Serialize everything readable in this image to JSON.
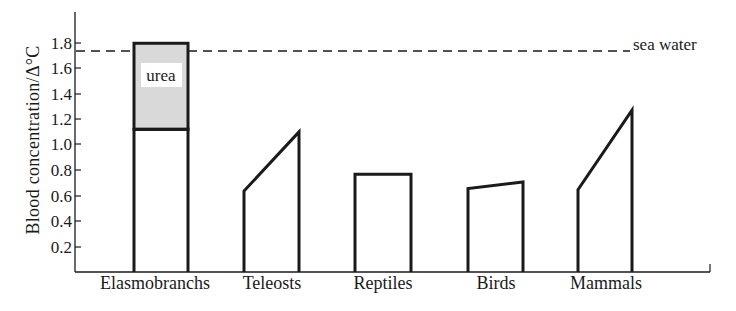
{
  "chart_data": {
    "type": "bar",
    "title": "",
    "xlabel": "",
    "ylabel": "Blood concentration/Δ°C",
    "ylim": [
      0,
      2.0
    ],
    "yticks": [
      0.2,
      0.4,
      0.6,
      0.8,
      1.0,
      1.2,
      1.4,
      1.6,
      1.8
    ],
    "ytick_labels": [
      "0.2",
      "0.4",
      "0.6",
      "0.8",
      "1.0",
      "1.2",
      "1.4",
      "1.6",
      "1.8"
    ],
    "grid": false,
    "legend": null,
    "categories": [
      "Elasmobranchs",
      "Teleosts",
      "Reptiles",
      "Birds",
      "Mammals"
    ],
    "series": [
      {
        "name": "Blood concentration (range low)",
        "values": [
          1.11,
          0.63,
          0.76,
          0.65,
          0.64
        ]
      },
      {
        "name": "Blood concentration (range high)",
        "values": [
          1.11,
          1.09,
          0.76,
          0.7,
          1.26
        ]
      },
      {
        "name": "Urea contribution (Elasmobranchs)",
        "values": [
          0.67,
          0,
          0,
          0,
          0
        ]
      }
    ],
    "stacked_segment": {
      "category": "Elasmobranchs",
      "base": 1.11,
      "top": 1.78,
      "label": "urea",
      "fill": "#d9d9d9"
    },
    "reference_lines": [
      {
        "orientation": "horizontal",
        "value": 1.72,
        "style": "dashed",
        "label": "sea water"
      }
    ],
    "annotations": [
      {
        "text": "urea",
        "category": "Elasmobranchs",
        "y": 1.52
      },
      {
        "text": "sea water",
        "y": 1.72,
        "position": "right"
      }
    ]
  },
  "labels": {
    "ylabel": "Blood concentration/Δ°C",
    "sea_water": "sea water",
    "urea": "urea",
    "categories": [
      "Elasmobranchs",
      "Teleosts",
      "Reptiles",
      "Birds",
      "Mammals"
    ],
    "yticks": [
      "0.2",
      "0.4",
      "0.6",
      "0.8",
      "1.0",
      "1.2",
      "1.4",
      "1.6",
      "1.8"
    ]
  },
  "colors": {
    "ink": "#1a1a1a",
    "urea_fill": "#d9d9d9",
    "background": "#ffffff"
  }
}
